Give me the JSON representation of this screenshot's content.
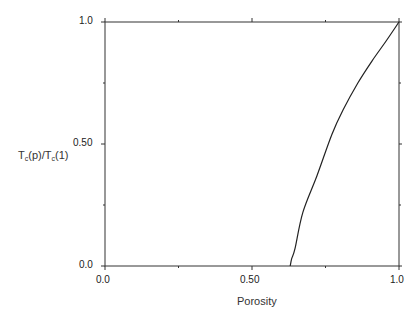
{
  "chart_data": {
    "type": "line",
    "title": "",
    "xlabel": "Porosity",
    "ylabel": "Tc(p)/Tc(1)",
    "ylabel_parts": {
      "t1": "T",
      "s1": "c",
      "mid": "(p)/T",
      "s2": "c",
      "end": "(1)"
    },
    "xlim": [
      0.0,
      1.0
    ],
    "ylim": [
      0.0,
      1.0
    ],
    "x_ticks": [
      0.0,
      0.25,
      0.5,
      0.75,
      1.0
    ],
    "x_tick_labels": [
      "0.0",
      "",
      "0.50",
      "",
      "1.0"
    ],
    "y_ticks": [
      0.0,
      0.25,
      0.5,
      0.75,
      1.0
    ],
    "y_tick_labels": [
      "0.0",
      "",
      "0.50",
      "",
      "1.0"
    ],
    "grid": false,
    "legend": null,
    "series": [
      {
        "name": "Tc(p)/Tc(1)",
        "color": "#222222",
        "x": [
          0.63,
          0.635,
          0.646,
          0.673,
          0.721,
          0.772,
          0.81,
          0.86,
          0.908,
          0.955,
          1.0
        ],
        "y": [
          0.0,
          0.03,
          0.07,
          0.22,
          0.37,
          0.54,
          0.64,
          0.75,
          0.84,
          0.92,
          1.0
        ]
      }
    ]
  }
}
